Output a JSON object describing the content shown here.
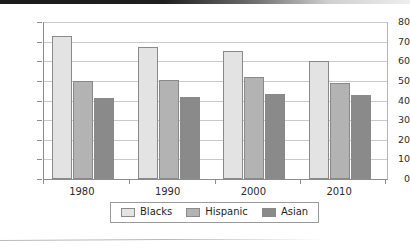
{
  "chart_data": {
    "type": "bar",
    "title": "",
    "subtitle": "",
    "xlabel": "",
    "ylabel": "",
    "categories": [
      "1980",
      "1990",
      "2000",
      "2010"
    ],
    "series": [
      {
        "name": "Blacks",
        "color": "#e3e3e3",
        "values": [
          73,
          67.5,
          65,
          60
        ]
      },
      {
        "name": "Hispanic",
        "color": "#b3b3b3",
        "values": [
          50,
          50.5,
          52,
          49
        ]
      },
      {
        "name": "Asian",
        "color": "#8a8a8a",
        "values": [
          41.5,
          42,
          43.5,
          43
        ]
      }
    ],
    "ylim": [
      0,
      80
    ],
    "ytick_labels": [
      "80",
      "70",
      "60",
      "50",
      "40",
      "30",
      "20",
      "10",
      "0"
    ],
    "ytick_values": [
      80,
      70,
      60,
      50,
      40,
      30,
      20,
      10,
      0
    ],
    "grid": true,
    "grid_axis": "y",
    "legend_position": "bottom",
    "bar_border_color": "#8a8a8a",
    "axis_color": "#8c8c8c",
    "gridline_color": "#c9c9c9"
  }
}
